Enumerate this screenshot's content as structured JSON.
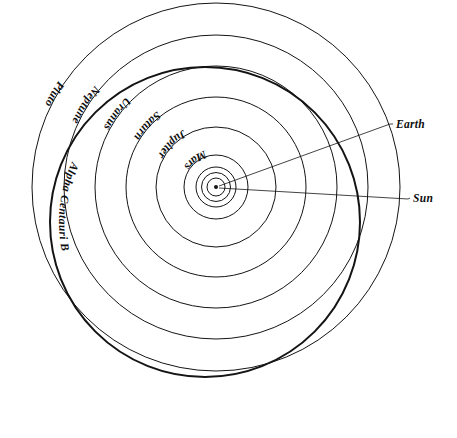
{
  "diagram": {
    "background_color": "#ffffff",
    "stroke_color": "#141414",
    "center": {
      "x": 216,
      "y": 187
    },
    "sun_marker": {
      "label": "sun-dot",
      "radius": 2.0
    },
    "orbits": [
      {
        "name": "mercury-orbit",
        "label": "",
        "radius": 9,
        "stroke_width": 1.0,
        "labelled": false
      },
      {
        "name": "venus-orbit",
        "label": "",
        "radius": 14.5,
        "stroke_width": 1.0,
        "labelled": false
      },
      {
        "name": "earth-orbit",
        "label": "Earth",
        "radius": 20,
        "stroke_width": 1.0,
        "labelled": true,
        "label_kind": "leader"
      },
      {
        "name": "mars-orbit",
        "label": "Mars",
        "radius": 32,
        "stroke_width": 1.0,
        "labelled": true,
        "label_kind": "curved",
        "label_angle_deg": 252,
        "label_offset": 6
      },
      {
        "name": "jupiter-orbit",
        "label": "Jupiter",
        "radius": 60,
        "stroke_width": 1.0,
        "labelled": true,
        "label_kind": "curved",
        "label_angle_deg": 240,
        "label_offset": 6
      },
      {
        "name": "saturn-orbit",
        "label": "Saturn",
        "radius": 90,
        "stroke_width": 1.0,
        "labelled": true,
        "label_kind": "curved",
        "label_angle_deg": 232,
        "label_offset": 6
      },
      {
        "name": "uranus-orbit",
        "label": "Uranus",
        "radius": 121,
        "stroke_width": 1.0,
        "labelled": true,
        "label_kind": "curved",
        "label_angle_deg": 225,
        "label_offset": 6
      },
      {
        "name": "neptune-orbit",
        "label": "Neptune",
        "radius": 152,
        "stroke_width": 1.0,
        "labelled": true,
        "label_kind": "curved",
        "label_angle_deg": 220,
        "label_offset": 6
      },
      {
        "name": "pluto-orbit",
        "label": "Pluto",
        "radius": 184,
        "stroke_width": 1.0,
        "labelled": true,
        "label_kind": "curved",
        "label_angle_deg": 214,
        "label_offset": 6
      }
    ],
    "alpha_centauri": {
      "name": "alpha-centauri-b-orbit",
      "label": "Alpha Centauri B",
      "center": {
        "x": 205,
        "y": 222
      },
      "radius": 155,
      "stroke_width": 2.0,
      "label_kind": "curved",
      "label_angle_deg": 205
    },
    "leader_labels": [
      {
        "name": "earth-callout",
        "label": "Earth",
        "text_x": 396,
        "text_y": 128,
        "line": {
          "x1": 219,
          "y1": 186,
          "x2": 390,
          "y2": 124
        }
      },
      {
        "name": "sun-callout",
        "label": "Sun",
        "text_x": 413,
        "text_y": 202,
        "line": {
          "x1": 219,
          "y1": 188,
          "x2": 408,
          "y2": 199
        }
      }
    ]
  }
}
